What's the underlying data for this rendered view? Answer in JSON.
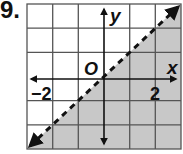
{
  "problem_number": "9.",
  "graph": {
    "x_axis_label": "x",
    "y_axis_label": "y",
    "origin_label": "O",
    "tick_labels": {
      "x_negative": "−2",
      "x_positive": "2"
    },
    "x_range": [
      -3,
      3
    ],
    "y_range": [
      -3,
      3
    ],
    "boundary_line": {
      "equation": "y = x",
      "style": "dashed"
    },
    "shaded_region": "below the line (y < x)",
    "colors": {
      "shade": "#c8c8c8",
      "grid": "#555555",
      "axes": "#111111",
      "background": "#ffffff"
    }
  }
}
